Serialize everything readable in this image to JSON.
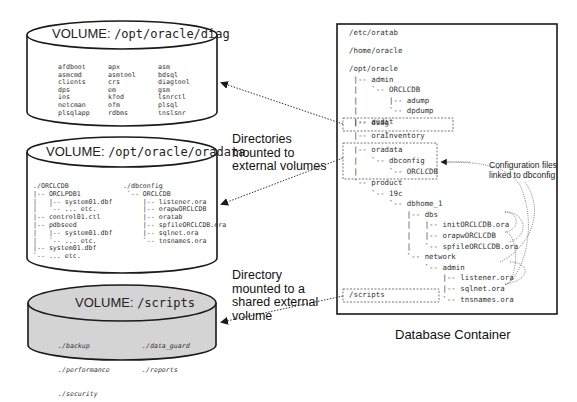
{
  "volumes": [
    {
      "id": "diag",
      "title_prefix": "VOLUME:",
      "title_path": "/opt/oracle/diag",
      "fill": "#ffffff",
      "columns": [
        [
          "afdboot",
          "asmcmd",
          "clients",
          "dps",
          "ios",
          "netcman",
          "plsqlapp"
        ],
        [
          "apx",
          "asmtool",
          "crs",
          "em",
          "kfod",
          "ofm",
          "rdbms"
        ],
        [
          "asm",
          "bdsql",
          "diagtool",
          "gsm",
          "lsnrctl",
          "plsql",
          "tnslsnr"
        ]
      ]
    },
    {
      "id": "oradata",
      "title_prefix": "VOLUME:",
      "title_path": "/opt/oracle/oradata",
      "fill": "#ffffff",
      "left_tree": "./ORCLCDB\n|-- ORCLPDB1\n|   |-- system01.dbf\n|   `-- ... etc.\n|-- control01.ctl\n|-- pdbseed\n|   |-- system01.dbf\n|   `-- ... etc.\n|-- system01.dbf\n`-- ... etc.",
      "right_tree": "./dbconfig\n `-- ORCLCDB\n     |-- listener.ora\n     |-- orapwORCLCDB\n     |-- oratab\n     |-- spfileORCLCDB.ora\n     |-- sqlnet.ora\n     `-- tnsnames.ora"
    },
    {
      "id": "scripts",
      "title_prefix": "VOLUME:",
      "title_path": "/scripts",
      "fill": "#d4d4d4",
      "left_items": [
        "./backup",
        "./performance",
        "./security"
      ],
      "right_items": [
        "./data_guard",
        "./reports"
      ]
    }
  ],
  "annotations": {
    "mounted_external": "Directories mounted to external volumes",
    "mounted_shared": "Directory mounted to a shared external volume",
    "config_linked": "Configuration files linked to dbconfig",
    "container_caption": "Database Container"
  },
  "container": {
    "paths": [
      "/etc/oratab",
      "/home/oracle"
    ],
    "tree_top": "/opt/oracle\n |-- admin\n |   `-- ORCLCDB\n |       |-- adump\n |       `-- dpdump\n |-- audit",
    "diag_row": " |-- diag",
    "mid_row": " |-- oraInventory",
    "oradata_rows": " |-- oradata\n |   `-- dbconfig\n |       `-- ORCLCDB",
    "tree_bottom": " `-- product\n     `-- 19c\n         `-- dbhome_1\n             |-- dbs\n             |   |-- initORCLCDB.ora\n             |   |-- orapwORCLCDB\n             |   `-- spfileORCLCDB.ora\n             `-- network\n                 `-- admin\n                     |-- listener.ora\n                     |-- sqlnet.ora\n                     `-- tnsnames.ora",
    "scripts_row": "/scripts"
  },
  "colors": {
    "stroke": "#1a1a1a",
    "dotted": "#555555",
    "scripts_fill": "#d4d4d4"
  }
}
